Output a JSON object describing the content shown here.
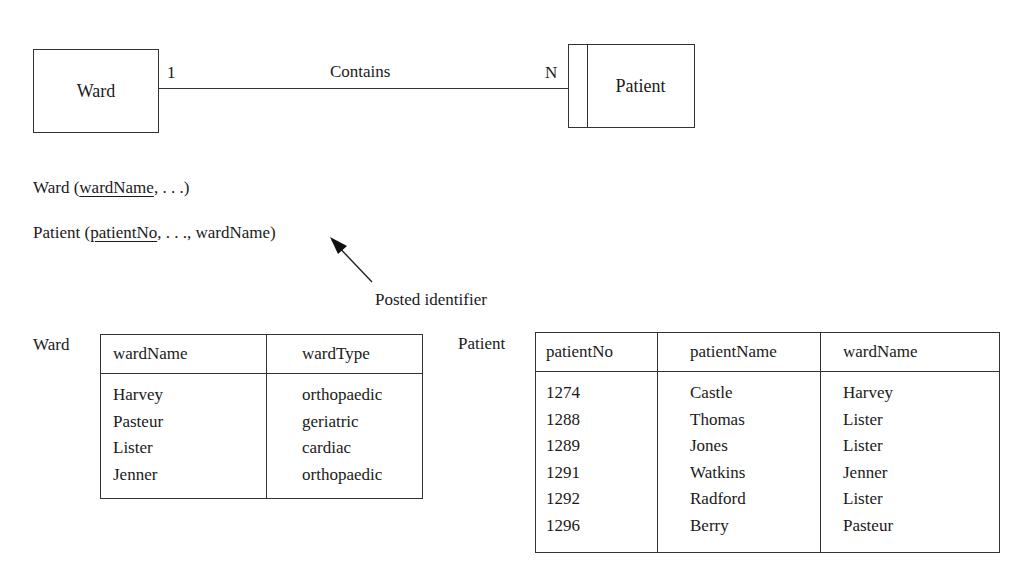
{
  "er_diagram": {
    "entity_left": "Ward",
    "entity_right": "Patient",
    "relationship": "Contains",
    "cardinality_left": "1",
    "cardinality_right": "N"
  },
  "schemas": {
    "ward": {
      "name": "Ward",
      "open": " (",
      "key": "wardName",
      "rest": ", . . .)"
    },
    "patient": {
      "name": "Patient",
      "open": " (",
      "key": "patientNo",
      "rest": ", . . ., wardName)"
    }
  },
  "annotation": {
    "label": "Posted identifier"
  },
  "ward_table": {
    "label": "Ward",
    "headers": [
      "wardName",
      "wardType"
    ],
    "rows": [
      [
        "Harvey",
        "orthopaedic"
      ],
      [
        "Pasteur",
        "geriatric"
      ],
      [
        "Lister",
        "cardiac"
      ],
      [
        "Jenner",
        "orthopaedic"
      ]
    ]
  },
  "patient_table": {
    "label": "Patient",
    "headers": [
      "patientNo",
      "patientName",
      "wardName"
    ],
    "rows": [
      [
        "1274",
        "Castle",
        "Harvey"
      ],
      [
        "1288",
        "Thomas",
        "Lister"
      ],
      [
        "1289",
        "Jones",
        "Lister"
      ],
      [
        "1291",
        "Watkins",
        "Jenner"
      ],
      [
        "1292",
        "Radford",
        "Lister"
      ],
      [
        "1296",
        "Berry",
        "Pasteur"
      ]
    ]
  }
}
